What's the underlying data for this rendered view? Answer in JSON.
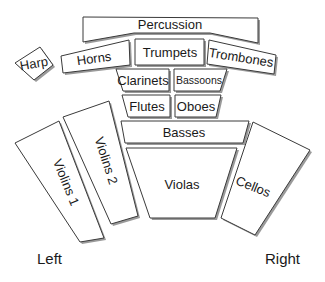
{
  "diagram": {
    "sections": [
      {
        "id": "percussion",
        "label": "Percussion"
      },
      {
        "id": "harp",
        "label": "Harp"
      },
      {
        "id": "horns",
        "label": "Horns"
      },
      {
        "id": "trumpets",
        "label": "Trumpets"
      },
      {
        "id": "trombones",
        "label": "Trombones"
      },
      {
        "id": "clarinets",
        "label": "Clarinets"
      },
      {
        "id": "bassoons",
        "label": "Bassoons"
      },
      {
        "id": "flutes",
        "label": "Flutes"
      },
      {
        "id": "oboes",
        "label": "Oboes"
      },
      {
        "id": "basses",
        "label": "Basses"
      },
      {
        "id": "violins1",
        "label": "Violins 1"
      },
      {
        "id": "violins2",
        "label": "Violins 2"
      },
      {
        "id": "violas",
        "label": "Violas"
      },
      {
        "id": "cellos",
        "label": "Cellos"
      }
    ],
    "orientation": {
      "left": "Left",
      "right": "Right"
    },
    "colors": {
      "fill": "#ffffff",
      "stroke": "#3a3a3a",
      "shadow": "#9a9a9a",
      "text": "#1a1a1a"
    }
  }
}
